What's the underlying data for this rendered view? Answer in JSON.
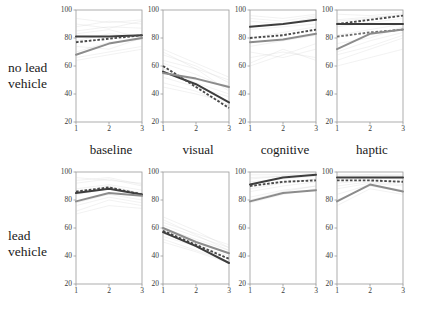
{
  "figure": {
    "row_labels": [
      "no lead\nvehicle",
      "lead\nvehicle"
    ],
    "col_labels": [
      "baseline",
      "visual",
      "cognitive",
      "haptic"
    ]
  },
  "colors": {
    "dark_line": "#3d3d3d",
    "gray_line": "#8c8c8c",
    "dashed_line": "#4a4a4a",
    "background_trace": "#c9c9c9",
    "axis": "#9a9a9a",
    "text": "#1a1a1a"
  },
  "chart_data": {
    "type": "line",
    "title": "",
    "xlabel": "",
    "ylabel": "",
    "xlim": [
      1,
      3
    ],
    "ylim": [
      20,
      100
    ],
    "x": [
      1,
      2,
      3
    ],
    "xticks": [
      "1",
      "2",
      "3"
    ],
    "yticks": [
      "20",
      "40",
      "60",
      "80",
      "100"
    ],
    "grid": false,
    "legend_position": "none",
    "row_factor": "lead vehicle presence",
    "col_factor": "secondary task condition",
    "panels": [
      {
        "row": "no lead vehicle",
        "col": "baseline",
        "series": [
          {
            "name": "dark-solid",
            "style": "solid-dark",
            "values": [
              81,
              81,
              82
            ]
          },
          {
            "name": "dashed",
            "style": "dashed-dark",
            "values": [
              77,
              79.5,
              82
            ]
          },
          {
            "name": "gray-solid",
            "style": "solid-gray",
            "values": [
              68,
              76,
              80
            ]
          }
        ]
      },
      {
        "row": "no lead vehicle",
        "col": "visual",
        "series": [
          {
            "name": "dark-solid",
            "style": "solid-dark",
            "values": [
              56,
              47,
              34
            ]
          },
          {
            "name": "dashed",
            "style": "dashed-dark",
            "values": [
              60,
              45,
              30
            ]
          },
          {
            "name": "gray-solid",
            "style": "solid-gray",
            "values": [
              55,
              51,
              45
            ]
          }
        ]
      },
      {
        "row": "no lead vehicle",
        "col": "cognitive",
        "series": [
          {
            "name": "dark-solid",
            "style": "solid-dark",
            "values": [
              88,
              90,
              93
            ]
          },
          {
            "name": "dashed",
            "style": "dashed-dark",
            "values": [
              80,
              82,
              86
            ]
          },
          {
            "name": "gray-solid",
            "style": "solid-gray",
            "values": [
              77,
              79,
              83
            ]
          }
        ]
      },
      {
        "row": "no lead vehicle",
        "col": "haptic",
        "series": [
          {
            "name": "dashed-upper",
            "style": "dashed-dark",
            "values": [
              90,
              93,
              96
            ]
          },
          {
            "name": "dark-solid",
            "style": "solid-dark",
            "values": [
              90,
              90,
              90
            ]
          },
          {
            "name": "dashed-lower",
            "style": "dashed-light",
            "values": [
              81,
              84,
              86
            ]
          },
          {
            "name": "gray-solid",
            "style": "solid-gray",
            "values": [
              72,
              83,
              86
            ]
          }
        ]
      },
      {
        "row": "lead vehicle",
        "col": "baseline",
        "series": [
          {
            "name": "dashed",
            "style": "dashed-dark",
            "values": [
              86,
              89,
              84
            ]
          },
          {
            "name": "dark-solid",
            "style": "solid-dark",
            "values": [
              85,
              88,
              84
            ]
          },
          {
            "name": "gray-solid",
            "style": "solid-gray",
            "values": [
              79,
              85,
              83
            ]
          }
        ]
      },
      {
        "row": "lead vehicle",
        "col": "visual",
        "series": [
          {
            "name": "gray-solid",
            "style": "solid-gray",
            "values": [
              60,
              50,
              42
            ]
          },
          {
            "name": "dashed",
            "style": "dashed-dark",
            "values": [
              58,
              48,
              38
            ]
          },
          {
            "name": "dark-solid",
            "style": "solid-dark",
            "values": [
              57,
              47,
              35
            ]
          }
        ]
      },
      {
        "row": "lead vehicle",
        "col": "cognitive",
        "series": [
          {
            "name": "dark-solid",
            "style": "solid-dark",
            "values": [
              91,
              96,
              98
            ]
          },
          {
            "name": "dashed",
            "style": "dashed-dark",
            "values": [
              90,
              93,
              94
            ]
          },
          {
            "name": "gray-solid",
            "style": "solid-gray",
            "values": [
              79,
              85,
              87
            ]
          }
        ]
      },
      {
        "row": "lead vehicle",
        "col": "haptic",
        "series": [
          {
            "name": "dark-solid",
            "style": "solid-dark",
            "values": [
              96,
              96,
              96
            ]
          },
          {
            "name": "dashed",
            "style": "dashed-dark",
            "values": [
              94,
              94,
              93
            ]
          },
          {
            "name": "gray-solid",
            "style": "solid-gray",
            "values": [
              79,
              91,
              86
            ]
          }
        ]
      }
    ],
    "background_traces": [
      {
        "panel": 0,
        "values": [
          [
            88,
            92,
            90
          ],
          [
            85,
            88,
            87
          ],
          [
            74,
            72,
            80
          ],
          [
            64,
            68,
            72
          ],
          [
            94,
            91,
            93
          ],
          [
            83,
            86,
            80
          ],
          [
            70,
            77,
            79
          ],
          [
            78,
            83,
            81
          ],
          [
            90,
            87,
            92
          ],
          [
            66,
            70,
            74
          ]
        ]
      },
      {
        "panel": 1,
        "values": [
          [
            64,
            58,
            50
          ],
          [
            68,
            60,
            48
          ],
          [
            52,
            45,
            38
          ],
          [
            58,
            48,
            40
          ],
          [
            72,
            62,
            52
          ],
          [
            48,
            42,
            32
          ],
          [
            62,
            54,
            44
          ],
          [
            55,
            50,
            46
          ],
          [
            70,
            58,
            42
          ],
          [
            45,
            40,
            34
          ]
        ]
      },
      {
        "panel": 2,
        "values": [
          [
            96,
            94,
            97
          ],
          [
            92,
            90,
            95
          ],
          [
            74,
            78,
            82
          ],
          [
            66,
            70,
            66
          ],
          [
            62,
            72,
            64
          ],
          [
            86,
            88,
            90
          ],
          [
            70,
            66,
            72
          ],
          [
            80,
            84,
            88
          ],
          [
            60,
            68,
            76
          ],
          [
            94,
            92,
            96
          ]
        ]
      },
      {
        "panel": 3,
        "values": [
          [
            97,
            96,
            98
          ],
          [
            93,
            95,
            96
          ],
          [
            88,
            91,
            94
          ],
          [
            70,
            78,
            84
          ],
          [
            64,
            72,
            80
          ],
          [
            60,
            66,
            72
          ],
          [
            82,
            86,
            90
          ],
          [
            76,
            80,
            88
          ],
          [
            92,
            94,
            97
          ],
          [
            68,
            74,
            82
          ]
        ]
      },
      {
        "panel": 4,
        "values": [
          [
            92,
            95,
            90
          ],
          [
            88,
            91,
            87
          ],
          [
            78,
            84,
            80
          ],
          [
            72,
            80,
            76
          ],
          [
            96,
            94,
            92
          ],
          [
            84,
            88,
            83
          ],
          [
            76,
            82,
            78
          ],
          [
            86,
            90,
            85
          ],
          [
            94,
            96,
            91
          ],
          [
            70,
            76,
            74
          ]
        ]
      },
      {
        "panel": 5,
        "values": [
          [
            64,
            56,
            48
          ],
          [
            62,
            54,
            46
          ],
          [
            56,
            48,
            40
          ],
          [
            60,
            52,
            44
          ],
          [
            68,
            58,
            46
          ],
          [
            52,
            44,
            36
          ],
          [
            58,
            50,
            42
          ],
          [
            54,
            47,
            38
          ],
          [
            66,
            55,
            44
          ],
          [
            50,
            43,
            35
          ]
        ]
      },
      {
        "panel": 6,
        "values": [
          [
            98,
            98,
            99
          ],
          [
            95,
            97,
            98
          ],
          [
            93,
            95,
            97
          ],
          [
            90,
            93,
            95
          ],
          [
            86,
            90,
            93
          ],
          [
            82,
            87,
            90
          ],
          [
            78,
            84,
            88
          ],
          [
            96,
            97,
            98
          ],
          [
            88,
            92,
            95
          ],
          [
            80,
            86,
            90
          ]
        ]
      },
      {
        "panel": 7,
        "values": [
          [
            98,
            98,
            98
          ],
          [
            96,
            97,
            97
          ],
          [
            94,
            96,
            95
          ],
          [
            92,
            94,
            93
          ],
          [
            88,
            92,
            90
          ],
          [
            80,
            90,
            86
          ],
          [
            76,
            88,
            84
          ],
          [
            97,
            98,
            97
          ],
          [
            90,
            93,
            91
          ],
          [
            84,
            91,
            87
          ]
        ]
      }
    ]
  }
}
